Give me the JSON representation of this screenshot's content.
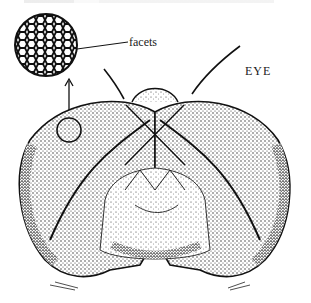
{
  "figure": {
    "labels": {
      "inset": "facets",
      "eye": "EYE"
    },
    "inset": {
      "description": "magnified circle showing hexagonal facet mesh",
      "center": [
        46,
        45
      ],
      "radius": 32
    },
    "colors": {
      "ink": "#1a1a1a",
      "paper": "#ffffff"
    }
  }
}
